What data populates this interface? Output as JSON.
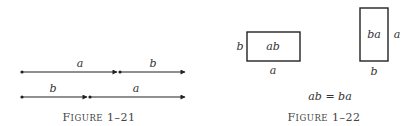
{
  "figure_1_21": {
    "caption_prefix": "F",
    "caption_rest": "IGURE",
    "caption_number": "1–21",
    "row1": {
      "first_label": "a",
      "second_label": "b"
    },
    "row2": {
      "first_label": "b",
      "second_label": "a"
    }
  },
  "figure_1_22": {
    "caption_prefix": "F",
    "caption_rest": "IGURE",
    "caption_number": "1–22",
    "rect1": {
      "inner_label": "ab",
      "side_label": "b",
      "bottom_label": "a"
    },
    "rect2": {
      "inner_label": "ba",
      "side_label": "a",
      "bottom_label": "b"
    },
    "equation": "ab = ba"
  },
  "colors": {
    "ink": "#222222",
    "background": "#ffffff"
  }
}
